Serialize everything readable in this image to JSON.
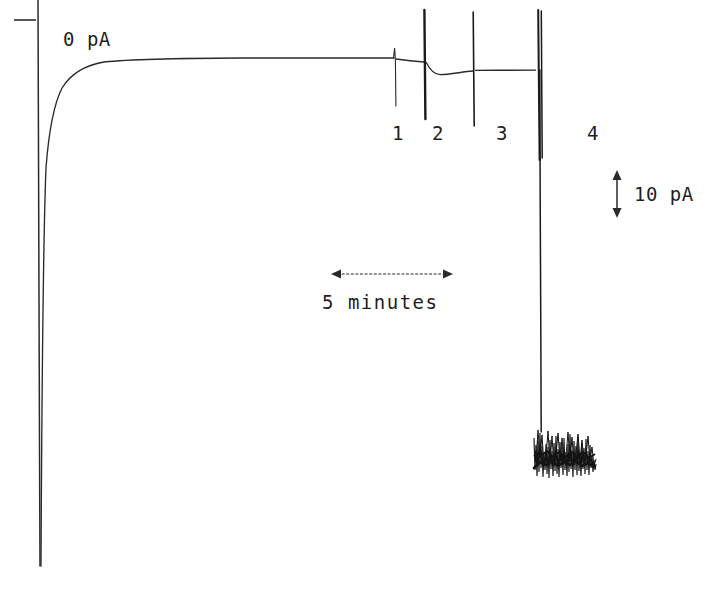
{
  "figure": {
    "kind": "electrophysiology-current-trace",
    "background_color": "#ffffff",
    "ink_color": "#1a1a1a",
    "zero_level_label": "0 pA",
    "current_scale_label": "10 pA",
    "time_scale_label": "5 minutes"
  },
  "chart_data": {
    "type": "line",
    "title": "",
    "xlabel": "",
    "ylabel": "",
    "x_units": "minutes",
    "y_units": "pA",
    "grid": false,
    "legend": null,
    "axes_visible": false,
    "zero_line_label": "0 pA",
    "scale_bars": [
      {
        "name": "current-scale-bar",
        "orientation": "vertical",
        "label": "10 pA",
        "value": 10,
        "units": "pA",
        "pixel_length": 43
      },
      {
        "name": "time-scale-bar",
        "orientation": "horizontal",
        "label": "5 minutes",
        "value": 5,
        "units": "minutes",
        "pixel_length": 120
      }
    ],
    "annotations": [
      {
        "label": "1",
        "x_px": 397,
        "y_px": 133,
        "event_x_px": 395
      },
      {
        "label": "2",
        "x_px": 437,
        "y_px": 133,
        "event_x_px": 424
      },
      {
        "label": "3",
        "x_px": 501,
        "y_px": 133,
        "event_x_px": 473
      },
      {
        "label": "4",
        "x_px": 592,
        "y_px": 133,
        "event_x_px": 539
      }
    ],
    "series": [
      {
        "name": "membrane-current",
        "description": "Whole-cell holding current: large inward capacitive transient at start, relaxation to a stable baseline near 0 pA, four drug-application artifacts (1-4), then a large sustained inward current with noisy channel activity.",
        "baseline_y_px": 59,
        "points_px": [
          [
            38,
            0
          ],
          [
            38,
            566
          ],
          [
            39,
            566
          ],
          [
            41,
            300
          ],
          [
            43,
            200
          ],
          [
            46,
            150
          ],
          [
            50,
            120
          ],
          [
            55,
            100
          ],
          [
            62,
            85
          ],
          [
            70,
            75
          ],
          [
            80,
            68
          ],
          [
            92,
            64
          ],
          [
            110,
            61
          ],
          [
            135,
            60
          ],
          [
            170,
            59
          ],
          [
            210,
            58.5
          ],
          [
            260,
            58
          ],
          [
            320,
            58
          ],
          [
            380,
            58
          ],
          [
            394,
            58
          ]
        ],
        "segments": [
          {
            "name": "post-event-1-dip",
            "points_px": [
              [
                396,
                59
              ],
              [
                404,
                60
              ],
              [
                412,
                61
              ],
              [
                420,
                62
              ],
              [
                424,
                62
              ]
            ]
          },
          {
            "name": "post-event-2-relaxation",
            "points_px": [
              [
                425,
                62
              ],
              [
                430,
                70
              ],
              [
                436,
                74
              ],
              [
                444,
                74
              ],
              [
                455,
                72
              ],
              [
                468,
                71
              ],
              [
                473,
                71
              ]
            ]
          },
          {
            "name": "plateau-to-event-4",
            "points_px": [
              [
                474,
                70
              ],
              [
                495,
                70
              ],
              [
                515,
                70
              ],
              [
                530,
                70
              ],
              [
                537,
                70
              ]
            ]
          },
          {
            "name": "large-inward-current",
            "points_px": [
              [
                538,
                70
              ],
              [
                538,
                430
              ]
            ]
          }
        ],
        "noise_burst": {
          "name": "channel-noise-burst",
          "x_start_px": 533,
          "x_end_px": 596,
          "y_top_px": 429,
          "y_bottom_px": 479,
          "amplitude_px": 50
        }
      }
    ],
    "events": [
      {
        "id": 1,
        "label": "1",
        "x_px": 395,
        "artifact_top_px": 48,
        "artifact_bottom_px": 106,
        "stroke_width": 1.1
      },
      {
        "id": 2,
        "label": "2",
        "x_px": 424,
        "artifact_top_px": 10,
        "artifact_bottom_px": 119,
        "stroke_width": 2.4
      },
      {
        "id": 3,
        "label": "3",
        "x_px": 473,
        "artifact_top_px": 12,
        "artifact_bottom_px": 126,
        "stroke_width": 1.5
      },
      {
        "id": 4,
        "label": "4",
        "x_px": 539,
        "artifact_top_px": 10,
        "artifact_bottom_px": 160,
        "stroke_width": 2.6
      }
    ]
  }
}
